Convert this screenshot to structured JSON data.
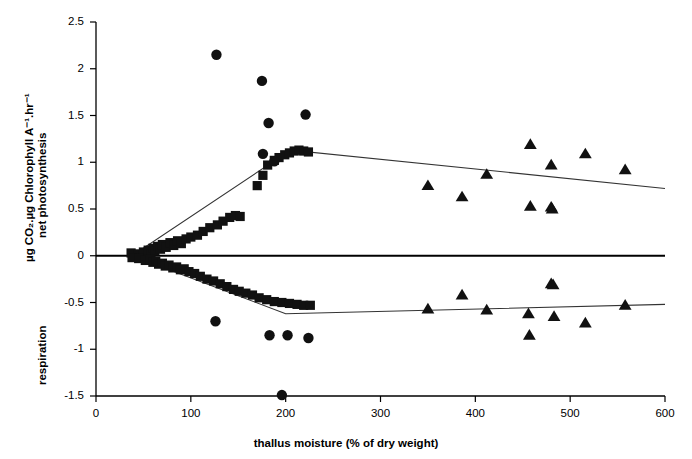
{
  "chart_data": {
    "type": "scatter",
    "title": "",
    "xlabel": "thallus moisture (% of dry weight)",
    "ylabel_line1": "µg CO₂.µg Chlorophyll A⁻¹.hr⁻¹",
    "ylabel_line2": "net photosynthesis",
    "ylabel_lower": "respiration",
    "xlim": [
      0,
      600
    ],
    "ylim": [
      -1.5,
      2.5
    ],
    "xticks": [
      0,
      100,
      200,
      300,
      400,
      500,
      600
    ],
    "xtick_labels": [
      "0",
      "100",
      "200",
      "300",
      "400",
      "500",
      "600"
    ],
    "yticks": [
      -1.5,
      -1,
      -0.5,
      0,
      0.5,
      1,
      1.5,
      2,
      2.5
    ],
    "ytick_labels": [
      "-1.5",
      "-1",
      "-0.5",
      "0",
      "0.5",
      "1",
      "1.5",
      "2",
      "2.5"
    ],
    "grid": false,
    "legend": "none",
    "marker_color": "#111111",
    "line_color": "#333333",
    "zero_line": 0,
    "series": [
      {
        "name": "net photosynthesis - squares",
        "marker": "square",
        "points": [
          [
            37,
            0.03
          ],
          [
            44,
            0.02
          ],
          [
            50,
            0.04
          ],
          [
            55,
            0.06
          ],
          [
            58,
            0.02
          ],
          [
            60,
            0.08
          ],
          [
            62,
            0.05
          ],
          [
            65,
            0.1
          ],
          [
            68,
            0.07
          ],
          [
            70,
            0.12
          ],
          [
            74,
            0.09
          ],
          [
            78,
            0.14
          ],
          [
            82,
            0.11
          ],
          [
            86,
            0.16
          ],
          [
            90,
            0.13
          ],
          [
            95,
            0.18
          ],
          [
            100,
            0.2
          ],
          [
            107,
            0.22
          ],
          [
            113,
            0.26
          ],
          [
            120,
            0.3
          ],
          [
            128,
            0.33
          ],
          [
            134,
            0.37
          ],
          [
            141,
            0.41
          ],
          [
            147,
            0.43
          ],
          [
            152,
            0.42
          ],
          [
            170,
            0.75
          ],
          [
            176,
            0.86
          ],
          [
            181,
            0.97
          ],
          [
            188,
            1.02
          ],
          [
            193,
            1.05
          ],
          [
            199,
            1.08
          ],
          [
            204,
            1.1
          ],
          [
            209,
            1.12
          ],
          [
            214,
            1.13
          ],
          [
            219,
            1.12
          ],
          [
            224,
            1.11
          ]
        ]
      },
      {
        "name": "respiration - squares",
        "marker": "square",
        "points": [
          [
            38,
            -0.02
          ],
          [
            45,
            -0.03
          ],
          [
            52,
            -0.05
          ],
          [
            57,
            -0.04
          ],
          [
            60,
            -0.07
          ],
          [
            63,
            -0.06
          ],
          [
            66,
            -0.09
          ],
          [
            70,
            -0.08
          ],
          [
            73,
            -0.11
          ],
          [
            77,
            -0.1
          ],
          [
            81,
            -0.13
          ],
          [
            85,
            -0.12
          ],
          [
            89,
            -0.15
          ],
          [
            93,
            -0.14
          ],
          [
            98,
            -0.17
          ],
          [
            104,
            -0.19
          ],
          [
            110,
            -0.22
          ],
          [
            117,
            -0.25
          ],
          [
            124,
            -0.27
          ],
          [
            131,
            -0.3
          ],
          [
            138,
            -0.33
          ],
          [
            145,
            -0.36
          ],
          [
            151,
            -0.38
          ],
          [
            158,
            -0.4
          ],
          [
            165,
            -0.42
          ],
          [
            172,
            -0.45
          ],
          [
            180,
            -0.47
          ],
          [
            188,
            -0.49
          ],
          [
            196,
            -0.5
          ],
          [
            204,
            -0.51
          ],
          [
            212,
            -0.52
          ],
          [
            219,
            -0.53
          ],
          [
            226,
            -0.53
          ]
        ]
      },
      {
        "name": "net photosynthesis - circles",
        "marker": "circle",
        "points": [
          [
            127,
            2.15
          ],
          [
            175,
            1.87
          ],
          [
            182,
            1.42
          ],
          [
            221,
            1.51
          ],
          [
            176,
            1.09
          ],
          [
            188,
            1.01
          ]
        ]
      },
      {
        "name": "respiration - circles",
        "marker": "circle",
        "points": [
          [
            126,
            -0.7
          ],
          [
            183,
            -0.85
          ],
          [
            202,
            -0.85
          ],
          [
            224,
            -0.88
          ],
          [
            196,
            -1.49
          ]
        ]
      },
      {
        "name": "net photosynthesis - triangles",
        "marker": "triangle",
        "points": [
          [
            350,
            0.75
          ],
          [
            386,
            0.63
          ],
          [
            412,
            0.87
          ],
          [
            458,
            1.19
          ],
          [
            458,
            0.53
          ],
          [
            480,
            0.97
          ],
          [
            480,
            0.52
          ],
          [
            481,
            0.5
          ],
          [
            516,
            1.09
          ],
          [
            558,
            0.92
          ]
        ]
      },
      {
        "name": "respiration - triangles",
        "marker": "triangle",
        "points": [
          [
            350,
            -0.57
          ],
          [
            386,
            -0.42
          ],
          [
            412,
            -0.58
          ],
          [
            456,
            -0.62
          ],
          [
            457,
            -0.85
          ],
          [
            480,
            -0.3
          ],
          [
            482,
            -0.31
          ],
          [
            483,
            -0.65
          ],
          [
            516,
            -0.72
          ],
          [
            558,
            -0.53
          ]
        ]
      }
    ],
    "trend_lines": [
      {
        "name": "upper-trend-line",
        "vertices": [
          [
            38,
            0.0
          ],
          [
            205,
            1.13
          ],
          [
            600,
            0.72
          ]
        ]
      },
      {
        "name": "lower-trend-line",
        "vertices": [
          [
            38,
            0.0
          ],
          [
            200,
            -0.62
          ],
          [
            600,
            -0.52
          ]
        ]
      }
    ]
  }
}
